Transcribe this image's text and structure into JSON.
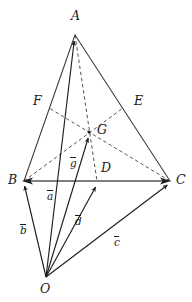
{
  "figure": {
    "kind": "geometry-diagram",
    "stroke_color": "#2b2b2b",
    "solid_line_color": "#3a3a3a",
    "dashed_line_color": "#4a4a4a",
    "background_color": "#ffffff",
    "width": 192,
    "height": 302
  },
  "vertices": [
    {
      "id": "A",
      "label": "A",
      "x": 75,
      "y": 35,
      "label_x": 71,
      "label_y": 10
    },
    {
      "id": "B",
      "label": "B",
      "x": 24,
      "y": 181,
      "label_x": 8,
      "label_y": 174
    },
    {
      "id": "C",
      "label": "C",
      "x": 170,
      "y": 181,
      "label_x": 176,
      "label_y": 174
    },
    {
      "id": "O",
      "label": "O",
      "x": 46,
      "y": 277,
      "label_x": 40,
      "label_y": 283
    },
    {
      "id": "D",
      "label": "D",
      "x": 97,
      "y": 181,
      "label_x": 101,
      "label_y": 162
    },
    {
      "id": "E",
      "label": "E",
      "x": 123,
      "y": 108,
      "label_x": 134,
      "label_y": 95
    },
    {
      "id": "F",
      "label": "F",
      "x": 49,
      "y": 108,
      "label_x": 33,
      "label_y": 95
    },
    {
      "id": "G",
      "label": "G",
      "x": 89,
      "y": 132,
      "label_x": 97,
      "label_y": 124
    }
  ],
  "vectors": [
    {
      "id": "a",
      "label": "a",
      "from": "O",
      "to": "A",
      "label_x": 47,
      "label_y": 190
    },
    {
      "id": "b",
      "label": "b",
      "from": "O",
      "to": "B",
      "label_x": 20,
      "label_y": 224
    },
    {
      "id": "c",
      "label": "c",
      "from": "O",
      "to": "C",
      "label_x": 114,
      "label_y": 236
    },
    {
      "id": "d",
      "label": "d",
      "from": "O",
      "to": "D",
      "label_x": 75,
      "label_y": 215
    },
    {
      "id": "g",
      "label": "g",
      "from": "O",
      "to": "G",
      "label_x": 70,
      "label_y": 157
    }
  ],
  "solid_edges": [
    {
      "id": "A-B",
      "from": "A",
      "to": "B"
    },
    {
      "id": "A-C",
      "from": "A",
      "to": "C"
    },
    {
      "id": "B-C",
      "from": "B",
      "to": "C"
    },
    {
      "id": "O-C",
      "from": "O",
      "to": "C"
    }
  ],
  "dashed_medians": [
    {
      "id": "A-D",
      "from": "A",
      "to": "D"
    },
    {
      "id": "B-E",
      "from": "B",
      "to": "E"
    },
    {
      "id": "C-F",
      "from": "C",
      "to": "F"
    }
  ]
}
